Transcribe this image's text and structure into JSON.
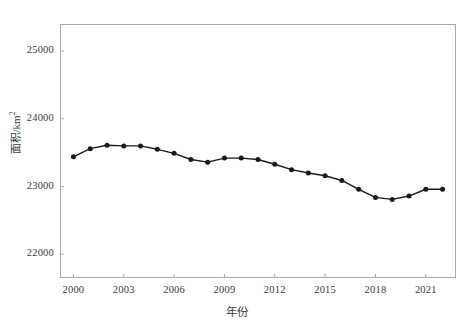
{
  "chart_data": {
    "type": "line",
    "title": "",
    "xlabel": "年份",
    "ylabel": "面积/km²",
    "ylabel_base": "面积/km",
    "ylabel_exp": "2",
    "xlim": [
      1999.2,
      2022.8
    ],
    "ylim": [
      21650,
      25400
    ],
    "grid": false,
    "legend": null,
    "marker": "filled-circle",
    "line_color": "#1a1a1a",
    "x": [
      2000,
      2001,
      2002,
      2003,
      2004,
      2005,
      2006,
      2007,
      2008,
      2009,
      2010,
      2011,
      2012,
      2013,
      2014,
      2015,
      2016,
      2017,
      2018,
      2019,
      2020,
      2021,
      2022
    ],
    "values": [
      23440,
      23560,
      23610,
      23600,
      23600,
      23550,
      23490,
      23400,
      23360,
      23420,
      23420,
      23400,
      23330,
      23250,
      23200,
      23160,
      23090,
      22960,
      22840,
      22810,
      22860,
      22960,
      22960
    ],
    "xticks": [
      2000,
      2003,
      2006,
      2009,
      2012,
      2015,
      2018,
      2021
    ],
    "xtick_labels": [
      "2000",
      "2003",
      "2006",
      "2009",
      "2012",
      "2015",
      "2018",
      "2021"
    ],
    "yticks": [
      22000,
      23000,
      24000,
      25000
    ],
    "ytick_labels": [
      "22000",
      "23000",
      "24000",
      "25000"
    ]
  },
  "figure": {
    "background": "#ffffff",
    "frame_color": "#a9a9a9",
    "text_color": "#3a3a3a"
  }
}
